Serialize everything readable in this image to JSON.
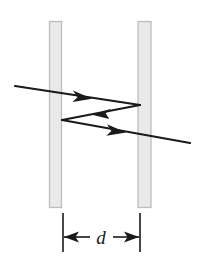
{
  "figure": {
    "name": "two-plate-reflection-diagram",
    "background_color": "#ffffff",
    "width": 203,
    "height": 265
  },
  "barriers": {
    "fill_color": "#e9e9e9",
    "stroke_color": "#bdbdbd",
    "left": {
      "label": "left-plate",
      "x": 49.5,
      "y": 21.5,
      "width": 12.0,
      "height": 186.0
    },
    "right": {
      "label": "right-plate",
      "x": 138.0,
      "y": 21.5,
      "width": 13.0,
      "height": 186.0
    }
  },
  "rays": {
    "stroke_color": "#1a1a1a",
    "stroke_width": 2.2,
    "incident": {
      "label": "incident-ray",
      "from_x": 15,
      "from_y": 86,
      "to_x": 140,
      "to_y": 105,
      "arrow_x": 88,
      "arrow_y": 97,
      "direction": "right"
    },
    "reflected": {
      "label": "reflected-ray",
      "from_x": 140,
      "from_y": 105,
      "to_x": 62,
      "to_y": 120,
      "arrow_x": 97,
      "arrow_y": 113,
      "direction": "left"
    },
    "exit": {
      "label": "transmitted-ray",
      "from_x": 62,
      "from_y": 120,
      "to_x": 190,
      "to_y": 143,
      "arrow_x": 122,
      "arrow_y": 131,
      "direction": "right"
    }
  },
  "dimension": {
    "label_text": "d",
    "label_name": "separation-label-d",
    "stroke_color": "#1a1a1a",
    "left_extension": {
      "x": 63,
      "y_top": 213,
      "y_bottom": 252
    },
    "right_extension": {
      "x": 140,
      "y_top": 213,
      "y_bottom": 252
    },
    "arrow_line_y": 237,
    "label_x": 101,
    "label_y": 244
  }
}
